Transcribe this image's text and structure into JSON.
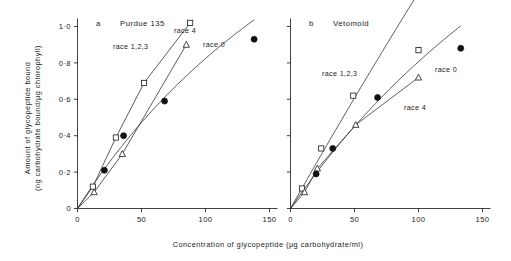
{
  "figure": {
    "x_axis_title": "Concentration of glycopeptide (μg carbohydrate/ml)",
    "y_axis_title_line1": "Amount of glycopeptide bound",
    "y_axis_title_line2": "(ng carbohydrate bound/μg chlorophyll)",
    "x_ticks": [
      "0",
      "50",
      "100",
      "150"
    ],
    "y_ticks": [
      "0",
      "0·2",
      "0·4",
      "0·6",
      "0·8",
      "1·0"
    ]
  },
  "panels": [
    {
      "letter": "a",
      "title": "Purdue 135"
    },
    {
      "letter": "b",
      "title": "Vetomold"
    }
  ],
  "series_labels": {
    "races123": "race 1,2,3",
    "race4": "race 4",
    "race0": "race 0"
  },
  "chart_data": {
    "type": "scatter",
    "xlabel": "Concentration of glycopeptide (μg carbohydrate/ml)",
    "ylabel": "Amount of glycopeptide bound (ng carbohydrate bound/μg chlorophyll)",
    "xlim": [
      0,
      155
    ],
    "ylim": [
      0,
      1.02
    ],
    "xticks": [
      0,
      50,
      100,
      150
    ],
    "yticks": [
      0,
      0.2,
      0.4,
      0.6,
      0.8,
      1.0
    ],
    "grid": false,
    "legend": "inline-annotations",
    "panels": [
      {
        "letter": "a",
        "title": "Purdue 135",
        "series": [
          {
            "name": "race 1,2,3",
            "marker": "open-square",
            "x": [
              12,
              30,
              52,
              88
            ],
            "y": [
              0.12,
              0.39,
              0.69,
              1.02
            ]
          },
          {
            "name": "race 4",
            "marker": "open-triangle",
            "x": [
              13,
              35,
              85
            ],
            "y": [
              0.09,
              0.3,
              0.9
            ]
          },
          {
            "name": "race 0",
            "marker": "filled-circle",
            "x": [
              21,
              36,
              68,
              138
            ],
            "y": [
              0.21,
              0.4,
              0.59,
              0.93
            ]
          }
        ]
      },
      {
        "letter": "b",
        "title": "Vetomold",
        "series": [
          {
            "name": "race 1,2,3",
            "marker": "open-square",
            "x": [
              9,
              24,
              49,
              100
            ],
            "y": [
              0.11,
              0.33,
              0.62,
              0.87
            ]
          },
          {
            "name": "race 4",
            "marker": "open-triangle",
            "x": [
              11,
              21,
              51,
              100
            ],
            "y": [
              0.09,
              0.22,
              0.46,
              0.72
            ]
          },
          {
            "name": "race 0",
            "marker": "filled-circle",
            "x": [
              20,
              33,
              68,
              133
            ],
            "y": [
              0.19,
              0.33,
              0.61,
              0.88
            ]
          }
        ]
      }
    ]
  }
}
